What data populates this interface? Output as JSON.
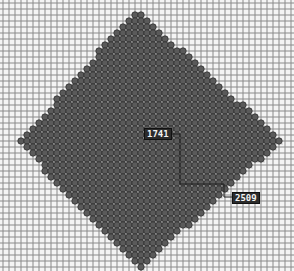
{
  "board": {
    "width": 294,
    "height": 271,
    "grid_pitch": 6,
    "grid_origin": [
      3,
      3
    ],
    "colors": {
      "background": "#f4f4f4",
      "grid_line": "#8a8a8a",
      "cell_fill": "#5a5a5a",
      "cell_stroke": "#2e2e2e",
      "cell_highlight": "#9a9a9a",
      "connector": "#1e1e1e"
    },
    "diamond": {
      "top": [
        136,
        8
      ],
      "right": [
        282,
        140
      ],
      "bottom": [
        140,
        270
      ],
      "left": [
        18,
        143
      ]
    }
  },
  "labels": [
    {
      "id": "start",
      "text": "1741",
      "x": 144,
      "y": 128
    },
    {
      "id": "end",
      "text": "2509",
      "x": 232,
      "y": 192
    }
  ],
  "connector": {
    "points": [
      [
        170,
        134
      ],
      [
        180,
        134
      ],
      [
        180,
        184
      ],
      [
        224,
        184
      ],
      [
        224,
        197
      ],
      [
        232,
        197
      ]
    ]
  }
}
